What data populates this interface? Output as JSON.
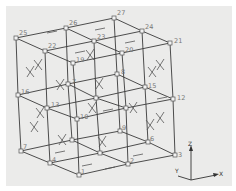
{
  "diagram": {
    "colors": {
      "background": "#ebebea",
      "edge": "#3a3a3a",
      "label": "#777777"
    },
    "nodes": [
      {
        "id": "1",
        "x": 79,
        "y": 175,
        "label": "1",
        "lx": 2,
        "ly": -1
      },
      {
        "id": "2",
        "x": 128,
        "y": 164,
        "label": "2",
        "lx": 2,
        "ly": -1
      },
      {
        "id": "3",
        "x": 175,
        "y": 155,
        "label": "3",
        "lx": 3,
        "ly": 2
      },
      {
        "id": "4",
        "x": 50,
        "y": 163,
        "label": "4",
        "lx": 2,
        "ly": -1
      },
      {
        "id": "5",
        "x": 100,
        "y": 153,
        "label": "",
        "lx": 2,
        "ly": -1
      },
      {
        "id": "6",
        "x": 148,
        "y": 142,
        "label": "6",
        "lx": 2,
        "ly": -1
      },
      {
        "id": "7",
        "x": 21,
        "y": 151,
        "label": "7",
        "lx": 2,
        "ly": -2
      },
      {
        "id": "8",
        "x": 72,
        "y": 140,
        "label": "",
        "lx": 2,
        "ly": -2
      },
      {
        "id": "9",
        "x": 120,
        "y": 131,
        "label": "9",
        "lx": 2,
        "ly": -1
      },
      {
        "id": "10",
        "x": 77,
        "y": 119,
        "label": "10",
        "lx": 3,
        "ly": 0
      },
      {
        "id": "11",
        "x": 126,
        "y": 108,
        "label": "",
        "lx": 2,
        "ly": 0
      },
      {
        "id": "12",
        "x": 173,
        "y": 99,
        "label": "12",
        "lx": 4,
        "ly": 1
      },
      {
        "id": "13",
        "x": 47,
        "y": 108,
        "label": "13",
        "lx": 4,
        "ly": -1
      },
      {
        "id": "14",
        "x": 96,
        "y": 98,
        "label": "",
        "lx": 2,
        "ly": -1
      },
      {
        "id": "15",
        "x": 145,
        "y": 87,
        "label": "15",
        "lx": 3,
        "ly": 1
      },
      {
        "id": "16",
        "x": 18,
        "y": 95,
        "label": "16",
        "lx": 3,
        "ly": -1
      },
      {
        "id": "17",
        "x": 68,
        "y": 84,
        "label": "7",
        "lx": 4,
        "ly": 0
      },
      {
        "id": "18",
        "x": 117,
        "y": 74,
        "label": "8",
        "lx": 4,
        "ly": 0
      },
      {
        "id": "19",
        "x": 73,
        "y": 63,
        "label": "19",
        "lx": 3,
        "ly": -1
      },
      {
        "id": "20",
        "x": 122,
        "y": 53,
        "label": "20",
        "lx": 3,
        "ly": -1
      },
      {
        "id": "21",
        "x": 170,
        "y": 43,
        "label": "21",
        "lx": 4,
        "ly": 0
      },
      {
        "id": "22",
        "x": 45,
        "y": 51,
        "label": "22",
        "lx": 3,
        "ly": -3
      },
      {
        "id": "23",
        "x": 94,
        "y": 41,
        "label": "23",
        "lx": 3,
        "ly": -2
      },
      {
        "id": "24",
        "x": 142,
        "y": 31,
        "label": "24",
        "lx": 3,
        "ly": -2
      },
      {
        "id": "25",
        "x": 16,
        "y": 38,
        "label": "25",
        "lx": 3,
        "ly": -3
      },
      {
        "id": "26",
        "x": 66,
        "y": 28,
        "label": "26",
        "lx": 3,
        "ly": -3
      },
      {
        "id": "27",
        "x": 114,
        "y": 18,
        "label": "27",
        "lx": 3,
        "ly": -3
      }
    ],
    "axes": {
      "origin": {
        "x": 191,
        "y": 180
      },
      "z_label": "Z",
      "x_label": "X",
      "y_label": "Y"
    }
  }
}
